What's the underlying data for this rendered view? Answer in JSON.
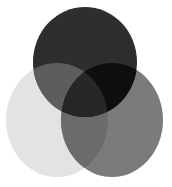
{
  "diagram": {
    "type": "venn",
    "sets": [
      {
        "id": "top",
        "cx": 85,
        "cy": 62,
        "rx": 52,
        "ry": 55,
        "color": "#2e2e2e"
      },
      {
        "id": "left",
        "cx": 57,
        "cy": 120,
        "rx": 51,
        "ry": 57,
        "color": "#e3e3e3"
      },
      {
        "id": "right",
        "cx": 112,
        "cy": 120,
        "rx": 51,
        "ry": 57,
        "color": "#7b7b7b"
      }
    ],
    "overlaps": {
      "top_left": "#5d5d5d",
      "top_right": "#0f0f0f",
      "left_right": "#6b6b6b",
      "all": "#272727"
    },
    "background": "#ffffff"
  }
}
